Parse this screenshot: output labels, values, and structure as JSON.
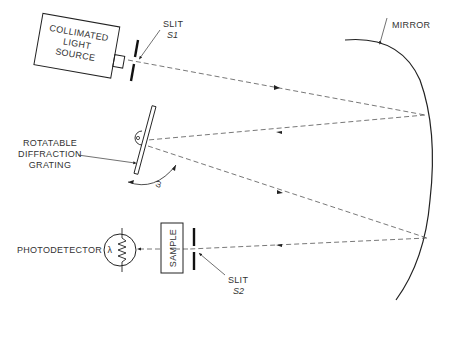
{
  "diagram": {
    "type": "optical-schematic",
    "components": {
      "source": {
        "label_lines": [
          "COLLIMATED",
          "LIGHT",
          "SOURCE"
        ]
      },
      "slit1": {
        "label": "SLIT",
        "sublabel": "S1"
      },
      "mirror": {
        "label": "MIRROR"
      },
      "grating": {
        "label_lines": [
          "ROTATABLE",
          "DIFFRACTION",
          "GRATING"
        ],
        "angle_symbol": "ω"
      },
      "sample": {
        "label": "SAMPLE"
      },
      "slit2": {
        "label": "SLIT",
        "sublabel": "S2"
      },
      "photodetector": {
        "label": "PHOTODETECTOR",
        "symbol": "λ"
      }
    },
    "light_path": [
      {
        "from": "slit1",
        "to": "mirror",
        "direction": "right"
      },
      {
        "from": "mirror",
        "to": "grating",
        "direction": "left"
      },
      {
        "from": "grating",
        "to": "mirror",
        "direction": "right"
      },
      {
        "from": "mirror",
        "to": "slit2",
        "direction": "left"
      },
      {
        "from": "slit2",
        "to": "sample",
        "direction": "left"
      },
      {
        "from": "sample",
        "to": "photodetector",
        "direction": "left"
      }
    ],
    "colors": {
      "ink": "#222222",
      "ray": "#555555",
      "background": "#ffffff"
    }
  }
}
